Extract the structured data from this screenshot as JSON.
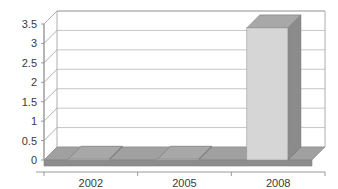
{
  "chart_data": {
    "type": "bar",
    "title": "",
    "subtitle": "",
    "xlabel": "",
    "ylabel": "",
    "categories": [
      "2002",
      "2005",
      "2008"
    ],
    "values": [
      0.02,
      0.02,
      3.4
    ],
    "series": [
      {
        "name": "series-1",
        "values": [
          0.02,
          0.02,
          3.4
        ]
      }
    ],
    "ylim": [
      0,
      3.5
    ],
    "ytick_labels": [
      "0",
      "0.5",
      "1",
      "1.5",
      "2",
      "2.5",
      "3",
      "3.5"
    ],
    "ytick_values": [
      0,
      0.5,
      1,
      1.5,
      2,
      2.5,
      3,
      3.5
    ],
    "xtick_labels": [
      "2002",
      "2005",
      "2008"
    ],
    "grid": true,
    "legend": false,
    "legend_position": "none",
    "three_d": true,
    "annotations": []
  },
  "style": {
    "bar_front_color": "#d6d6d6",
    "bar_side_color": "#8b8b8b",
    "bar_top_color": "#a8a8a8",
    "floor_color": "#a0a0a0",
    "floor_front_color": "#8d8d8d",
    "plot_background": "#ffffff",
    "gridline_color": "#b9b9b9",
    "axis_color": "#8e8e8e",
    "text_color": "#3a3a3a"
  }
}
